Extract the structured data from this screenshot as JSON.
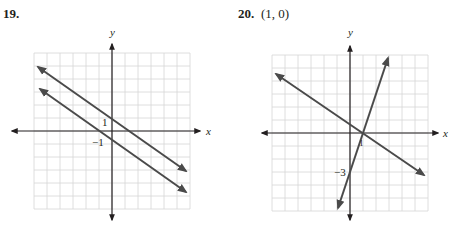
{
  "problems": [
    {
      "number": "19.",
      "answer": "",
      "x_axis_label": "x",
      "y_axis_label": "y",
      "tick_labels": [
        {
          "text": "1",
          "at": "y=1"
        },
        {
          "text": "−1",
          "at": "y=-1"
        }
      ]
    },
    {
      "number": "20.",
      "answer": "(1, 0)",
      "x_axis_label": "x",
      "y_axis_label": "y",
      "tick_labels": [
        {
          "text": "1",
          "at": "x=1"
        },
        {
          "text": "−3",
          "at": "y=-3"
        }
      ]
    }
  ],
  "colors": {
    "line": "#4a4a4a",
    "grid": "#d6d6d6",
    "axis": "#231f20"
  },
  "chart_data": [
    {
      "type": "line",
      "title": "19.",
      "xlabel": "x",
      "ylabel": "y",
      "xlim": [
        -6,
        6
      ],
      "ylim": [
        -6,
        6
      ],
      "grid": true,
      "series": [
        {
          "name": "y = -2/3 x + 1",
          "x": [
            -5.7,
            5.7
          ],
          "y": [
            4.8,
            -2.8
          ]
        },
        {
          "name": "y = -2/3 x - 1",
          "x": [
            -5.5,
            5.7
          ],
          "y": [
            2.67,
            -4.8
          ]
        }
      ],
      "annotations": [
        "1",
        "−1"
      ]
    },
    {
      "type": "line",
      "title": "20.  (1, 0)",
      "xlabel": "x",
      "ylabel": "y",
      "xlim": [
        -6,
        6
      ],
      "ylim": [
        -6,
        6
      ],
      "grid": true,
      "series": [
        {
          "name": "y = 3x - 3",
          "x": [
            -0.9,
            2.9
          ],
          "y": [
            -5.7,
            5.7
          ]
        },
        {
          "name": "y = -2/3 x + 2/3",
          "x": [
            -5.7,
            5.7
          ],
          "y": [
            4.47,
            -3.13
          ]
        }
      ],
      "annotations": [
        "1",
        "−3"
      ],
      "intersection": [
        1,
        0
      ]
    }
  ]
}
